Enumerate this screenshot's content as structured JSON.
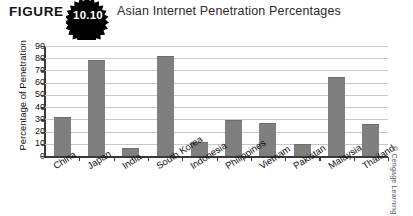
{
  "figure": {
    "label": "FIGURE",
    "number": "10.10",
    "title": "Asian Internet Penetration Percentages"
  },
  "credit": "© Cengage Learning",
  "chart_data": {
    "type": "bar",
    "title": "Asian Internet Penetration Percentages",
    "xlabel": "",
    "ylabel": "Percentage of Penetration",
    "ylim": [
      0,
      90
    ],
    "ytick_step": 10,
    "yticks": [
      0,
      10,
      20,
      30,
      40,
      50,
      60,
      70,
      80,
      90
    ],
    "grid": true,
    "legend": false,
    "bar_color": "#7f7f7f",
    "categories": [
      "China",
      "Japan",
      "India",
      "South Korea",
      "Indonesia",
      "Philippines",
      "Vietnam",
      "Pakistan",
      "Malaysia",
      "Thailand"
    ],
    "values": [
      31,
      78,
      6,
      81,
      11,
      29,
      26,
      9,
      64,
      25
    ]
  }
}
